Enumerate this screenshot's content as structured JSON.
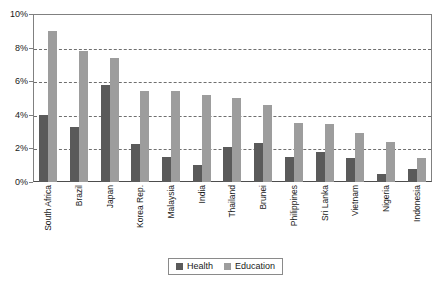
{
  "chart_data": {
    "type": "bar",
    "title": "",
    "subtitle": "",
    "xlabel": "",
    "ylabel": "",
    "ylim": [
      0,
      10
    ],
    "y_tick_labels": [
      "0%",
      "2%",
      "4%",
      "6%",
      "8%",
      "10%"
    ],
    "y_tick_values": [
      0,
      2,
      4,
      6,
      8,
      10
    ],
    "grid": true,
    "grid_axis": "y",
    "legend_position": "bottom",
    "value_unit": "%",
    "categories": [
      "South Africa",
      "Brazil",
      "Japan",
      "Korea Rep.",
      "Malaysia",
      "India",
      "Thailand",
      "Brunei",
      "Philippines",
      "Sri Lanka",
      "Vietnam",
      "Nigeria",
      "Indonesia"
    ],
    "series": [
      {
        "name": "Health",
        "color": "#5a5a5a",
        "values": [
          4.0,
          3.3,
          5.8,
          2.25,
          1.5,
          1.0,
          2.1,
          2.35,
          1.5,
          1.8,
          1.45,
          0.45,
          0.75
        ]
      },
      {
        "name": "Education",
        "color": "#9d9d9d",
        "values": [
          9.0,
          7.8,
          7.4,
          5.4,
          5.4,
          5.15,
          5.0,
          4.6,
          3.5,
          3.45,
          2.9,
          2.4,
          1.4
        ]
      }
    ]
  },
  "legend": {
    "entries": [
      {
        "label": "Health"
      },
      {
        "label": "Education"
      }
    ]
  },
  "colors": {
    "health": "#5a5a5a",
    "education": "#9d9d9d",
    "frame": "#808080",
    "grid": "#6f6f6f",
    "text": "#1a1a1a",
    "background": "#ffffff"
  }
}
